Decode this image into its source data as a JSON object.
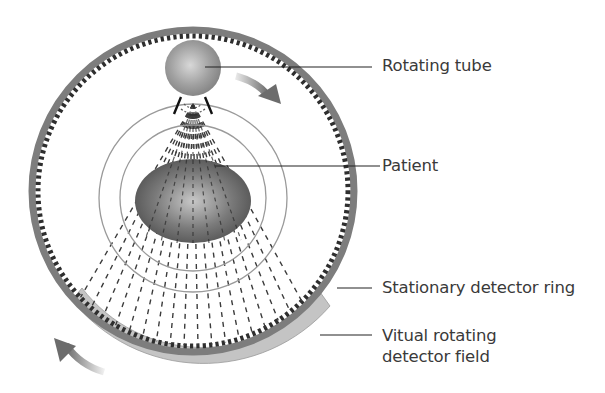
{
  "figure": {
    "labels": [
      {
        "id": "rotating-tube",
        "text": "Rotating tube"
      },
      {
        "id": "patient",
        "text": "Patient"
      },
      {
        "id": "stationary-ring",
        "text": "Stationary detector ring"
      },
      {
        "id": "virtual-field-line1",
        "text": "Vitual rotating"
      },
      {
        "id": "virtual-field-line2",
        "text": "detector field"
      }
    ],
    "colors": {
      "ring": "#7a7a7a",
      "detector_cells": "#2e2e2e",
      "virtual_field": "#bdbdbd",
      "tube": "#9a9a9a",
      "patient": "#5a5a5a",
      "beam": "#444444",
      "arrow": "#777777",
      "text": "#3a3a3a"
    },
    "geometry": {
      "ring_center": [
        193,
        191
      ],
      "ring_radius": 164,
      "tube_center": [
        193,
        68
      ],
      "tube_radius": 28,
      "patient_center": [
        193,
        201
      ],
      "patient_rx": 58,
      "patient_ry": 42,
      "orbit_radii": [
        94,
        73
      ]
    }
  }
}
